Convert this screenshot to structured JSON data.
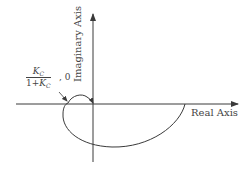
{
  "diagram": {
    "type": "nyquist-plot",
    "axes": {
      "real_label": "Real Axis",
      "imaginary_label": "Imaginary Axis"
    },
    "annotation": {
      "numerator_symbol": "K",
      "numerator_subscript": "C",
      "denominator_prefix": "1+",
      "denominator_symbol": "K",
      "denominator_subscript": "C",
      "suffix": ", 0"
    },
    "colors": {
      "line": "#3a3a3a",
      "background": "#ffffff"
    }
  }
}
